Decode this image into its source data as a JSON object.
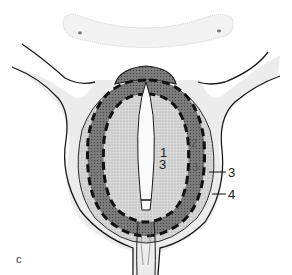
{
  "figure": {
    "panel_letter": "c",
    "labels": {
      "center_top": "1",
      "center_bottom": "3",
      "ring_upper": "2",
      "ring_lower": "3",
      "right_3": "3",
      "right_4": "4"
    },
    "colors": {
      "outline": "#1a1a1a",
      "outer_tissue": "#e4e4e4",
      "inner_zone": "#cfcfcf",
      "ring": "#7a7a7a",
      "cap": "#8c8c8c",
      "pale": "#f2f2f2"
    }
  }
}
